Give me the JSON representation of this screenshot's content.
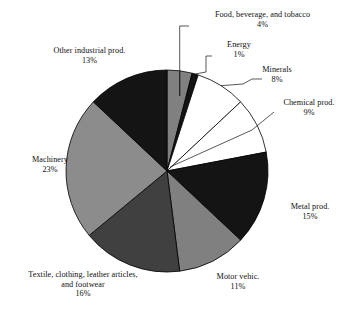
{
  "chart_data": {
    "type": "pie",
    "title": "",
    "subtitle": "",
    "xlabel": "",
    "ylabel": "",
    "grid": false,
    "legend_position": "none",
    "units": "percent",
    "start_angle_deg": 0,
    "direction": "clockwise",
    "center": {
      "x": 167,
      "y": 171
    },
    "radius": 101,
    "categories": [
      "Food, beverage, and tobacco",
      "Energy",
      "Minerals",
      "Chemical prod.",
      "Metal prod.",
      "Motor vehic.",
      "Textile, clothing, leather articles, and footwear",
      "Machinery",
      "Other industrial prod."
    ],
    "values": [
      4,
      1,
      8,
      9,
      15,
      11,
      16,
      23,
      13
    ],
    "value_labels": [
      "4%",
      "1%",
      "8%",
      "9%",
      "15%",
      "11%",
      "16%",
      "23%",
      "13%"
    ],
    "colors": [
      "#808080",
      "#141414",
      "#ffffff",
      "#ffffff",
      "#141414",
      "#808080",
      "#404040",
      "#8c8c8c",
      "#141414"
    ],
    "slice_edge_color": "#000000",
    "total": 100
  },
  "labels": [
    {
      "id": "food-beverage-tobacco",
      "title": "Food, beverage, and tobacco",
      "percent": "4%",
      "align": "center",
      "left": 181,
      "top": 10,
      "leader": true
    },
    {
      "id": "energy",
      "title": "Energy",
      "percent": "1%",
      "align": "center",
      "left": 203,
      "top": 40,
      "leader": true
    },
    {
      "id": "minerals",
      "title": "Minerals",
      "percent": "8%",
      "align": "center",
      "left": 240,
      "top": 65,
      "leader": true
    },
    {
      "id": "chemical-prod",
      "title": "Chemical prod.",
      "percent": "9%",
      "align": "center",
      "left": 272,
      "top": 98,
      "leader": true
    },
    {
      "id": "metal-prod",
      "title": "Metal prod.",
      "percent": "15%",
      "align": "center",
      "left": 278,
      "top": 202,
      "leader": false
    },
    {
      "id": "motor-vehic",
      "title": "Motor vehic.",
      "percent": "11%",
      "align": "center",
      "left": 205,
      "top": 272,
      "leader": false
    },
    {
      "id": "textile-clothing-leather-footwear",
      "title_line1": "Textile, clothing, leather articles,",
      "title_line2": "and footwear",
      "percent": "16%",
      "align": "center",
      "left": 7,
      "top": 270,
      "leader": false
    },
    {
      "id": "machinery",
      "title": "Machinery",
      "percent": "23%",
      "align": "center",
      "left": 19,
      "top": 155,
      "leader": false
    },
    {
      "id": "other-industrial-prod",
      "title": "Other industrial prod.",
      "percent": "13%",
      "align": "center",
      "left": 36,
      "top": 46,
      "leader": false
    }
  ]
}
